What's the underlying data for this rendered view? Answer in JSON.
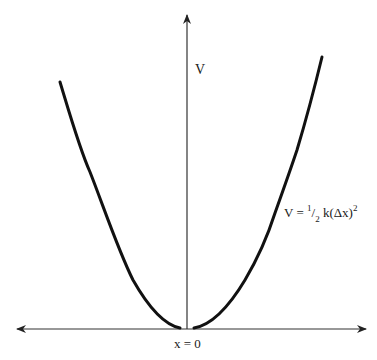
{
  "diagram": {
    "y_axis_label": "V",
    "x_origin_label": "x = 0",
    "equation": {
      "lhs": "V = ",
      "frac_num": "1",
      "frac_slash": "/",
      "frac_den": "2",
      "body": " k(Δx)",
      "exponent": "2"
    },
    "colors": {
      "curve": "#111111",
      "axes": "#333333",
      "background": "#ffffff"
    }
  }
}
